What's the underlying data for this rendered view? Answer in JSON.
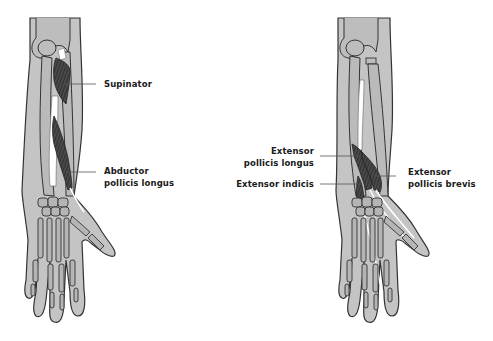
{
  "figure": {
    "panels": [
      {
        "id": "left-arm",
        "description": "Posterior forearm, deep layer (left view)",
        "labels": [
          {
            "id": "supinator",
            "lines": [
              "Supinator"
            ]
          },
          {
            "id": "abductor-pollicis-longus",
            "lines": [
              "Abductor",
              "pollicis longus"
            ]
          }
        ]
      },
      {
        "id": "right-arm",
        "description": "Posterior forearm, deep layer (right view)",
        "labels": [
          {
            "id": "extensor-pollicis-longus",
            "lines": [
              "Extensor",
              "pollicis longus"
            ]
          },
          {
            "id": "extensor-indicis",
            "lines": [
              "Extensor indicis"
            ]
          },
          {
            "id": "extensor-pollicis-brevis",
            "lines": [
              "Extensor",
              "pollicis brevis"
            ]
          }
        ]
      }
    ],
    "colors": {
      "skin": "#c4c4c4",
      "bone": "#b3b3b3",
      "outline": "#333333",
      "muscle": "#3a3a3a",
      "tendon": "#ffffff",
      "leader_line": "#555555",
      "label_text": "#1a1a1a"
    }
  }
}
